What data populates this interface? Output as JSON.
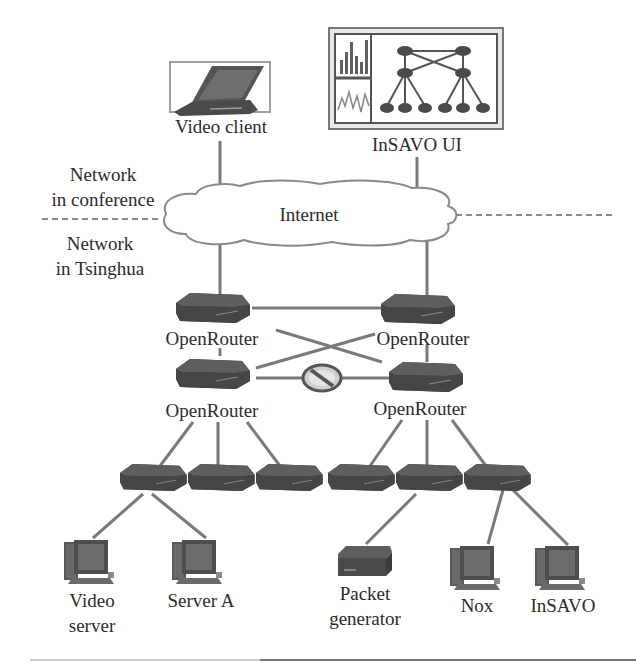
{
  "diagram": {
    "regions": {
      "upper_label_line1": "Network",
      "upper_label_line2": "in conference",
      "lower_label_line1": "Network",
      "lower_label_line2": "in Tsinghua"
    },
    "cloud": {
      "label": "Internet"
    },
    "top_devices": [
      {
        "id": "video-client",
        "label": "Video client",
        "icon": "laptop-icon"
      },
      {
        "id": "insavo-ui",
        "label": "InSAVO UI",
        "icon": "dashboard-screen-icon"
      }
    ],
    "core_routers": [
      {
        "id": "or-top-left",
        "label": "OpenRouter"
      },
      {
        "id": "or-top-right",
        "label": "OpenRouter"
      },
      {
        "id": "or-bottom-left",
        "label": "OpenRouter"
      },
      {
        "id": "or-bottom-right",
        "label": "OpenRouter"
      }
    ],
    "blocked_link": {
      "icon": "no-entry-icon",
      "between": [
        "or-bottom-left",
        "or-bottom-right"
      ]
    },
    "switches": 6,
    "end_hosts": [
      {
        "id": "video-server",
        "label_line1": "Video",
        "label_line2": "server",
        "icon": "desktop-pc-icon"
      },
      {
        "id": "server-a",
        "label_line1": "Server A",
        "label_line2": "",
        "icon": "desktop-pc-icon"
      },
      {
        "id": "packet-generator",
        "label_line1": "Packet",
        "label_line2": "generator",
        "icon": "packet-generator-icon"
      },
      {
        "id": "nox",
        "label_line1": "Nox",
        "label_line2": "",
        "icon": "desktop-pc-icon"
      },
      {
        "id": "insavo",
        "label_line1": "InSAVO",
        "label_line2": "",
        "icon": "desktop-pc-icon"
      }
    ],
    "colors": {
      "device": "#4a4a4a",
      "device_top": "#6a6a6a",
      "link": "#7a7a7a",
      "cloud_stroke": "#8a8a8a",
      "dash": "#8a8a8a",
      "text": "#2b2b2b"
    }
  }
}
